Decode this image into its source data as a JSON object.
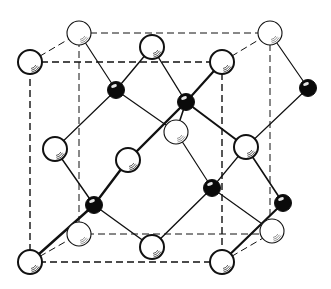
{
  "diagram": {
    "title": "",
    "type": "crystal-structure",
    "colors": {
      "line": "#111111",
      "white_atom_fill": "#ffffff",
      "black_atom_fill": "#0a0a0a",
      "background": "#ffffff"
    },
    "cube": {
      "front": [
        [
          30,
          62
        ],
        [
          222,
          62
        ],
        [
          222,
          262
        ],
        [
          30,
          262
        ]
      ],
      "back": [
        [
          79,
          33
        ],
        [
          270,
          33
        ],
        [
          270,
          234
        ],
        [
          79,
          234
        ]
      ]
    },
    "white_atoms": [
      {
        "id": "w-front-tl",
        "x": 30,
        "y": 62,
        "front": true
      },
      {
        "id": "w-back-tl",
        "x": 79,
        "y": 33,
        "front": false
      },
      {
        "id": "w-back-tr",
        "x": 270,
        "y": 33,
        "front": false
      },
      {
        "id": "w-front-tr",
        "x": 222,
        "y": 62,
        "front": true
      },
      {
        "id": "w-top-center",
        "x": 152,
        "y": 47,
        "front": true
      },
      {
        "id": "w-left-center",
        "x": 55,
        "y": 149,
        "front": true
      },
      {
        "id": "w-front-center",
        "x": 128,
        "y": 160,
        "front": true
      },
      {
        "id": "w-back-center",
        "x": 176,
        "y": 132,
        "front": false
      },
      {
        "id": "w-right-center",
        "x": 246,
        "y": 147,
        "front": true
      },
      {
        "id": "w-front-bl",
        "x": 30,
        "y": 262,
        "front": true
      },
      {
        "id": "w-back-bl",
        "x": 79,
        "y": 234,
        "front": false
      },
      {
        "id": "w-back-br",
        "x": 272,
        "y": 231,
        "front": false
      },
      {
        "id": "w-front-br",
        "x": 222,
        "y": 262,
        "front": true
      },
      {
        "id": "w-bottom-center",
        "x": 152,
        "y": 247,
        "front": true
      }
    ],
    "black_atoms": [
      {
        "id": "b1",
        "x": 116,
        "y": 90
      },
      {
        "id": "b2",
        "x": 186,
        "y": 102
      },
      {
        "id": "b3",
        "x": 308,
        "y": 88
      },
      {
        "id": "b4",
        "x": 94,
        "y": 205
      },
      {
        "id": "b5",
        "x": 212,
        "y": 188
      },
      {
        "id": "b6",
        "x": 283,
        "y": 203
      }
    ],
    "bonds": [
      {
        "a": "b1",
        "b": "w-back-tl",
        "w": 1.2
      },
      {
        "a": "b1",
        "b": "w-top-center",
        "w": 1.4
      },
      {
        "a": "b1",
        "b": "w-left-center",
        "w": 1.2
      },
      {
        "a": "b1",
        "b": "w-back-center",
        "w": 1.2
      },
      {
        "a": "b2",
        "b": "w-top-center",
        "w": 1.4
      },
      {
        "a": "b2",
        "b": "w-front-tr",
        "w": 2.2
      },
      {
        "a": "b2",
        "b": "w-back-center",
        "w": 1.6
      },
      {
        "a": "b2",
        "b": "w-right-center",
        "w": 2.0
      },
      {
        "a": "b2",
        "b": "w-front-center",
        "w": 2.4
      },
      {
        "a": "b3",
        "b": "w-back-tr",
        "w": 1.2
      },
      {
        "a": "b3",
        "b": "w-right-center",
        "w": 1.2
      },
      {
        "a": "b4",
        "b": "w-left-center",
        "w": 1.4
      },
      {
        "a": "b4",
        "b": "w-front-center",
        "w": 2.4
      },
      {
        "a": "b4",
        "b": "w-front-bl",
        "w": 2.4
      },
      {
        "a": "b4",
        "b": "w-bottom-center",
        "w": 1.4
      },
      {
        "a": "b5",
        "b": "w-back-center",
        "w": 1.2
      },
      {
        "a": "b5",
        "b": "w-right-center",
        "w": 1.2
      },
      {
        "a": "b5",
        "b": "w-bottom-center",
        "w": 1.4
      },
      {
        "a": "b5",
        "b": "w-back-br",
        "w": 1.2
      },
      {
        "a": "b6",
        "b": "w-front-br",
        "w": 2.2
      },
      {
        "a": "b6",
        "b": "w-right-center",
        "w": 1.6
      }
    ]
  }
}
